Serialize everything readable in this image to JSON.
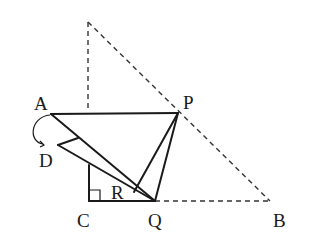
{
  "diagram": {
    "type": "geometry-folding",
    "labels": {
      "A": "A",
      "P": "P",
      "D": "D",
      "R": "R",
      "C": "C",
      "Q": "Q",
      "B": "B"
    },
    "points": {
      "apex": [
        88,
        22
      ],
      "A": [
        51,
        114
      ],
      "P": [
        178,
        113
      ],
      "D": [
        58,
        145
      ],
      "R": [
        134,
        192
      ],
      "C": [
        89,
        201
      ],
      "Q": [
        155,
        201
      ],
      "B": [
        270,
        201
      ]
    },
    "right_angle_at": "C",
    "colors": {
      "stroke": "#1a1a1a",
      "dashed": "#333333",
      "background": "#ffffff"
    }
  }
}
